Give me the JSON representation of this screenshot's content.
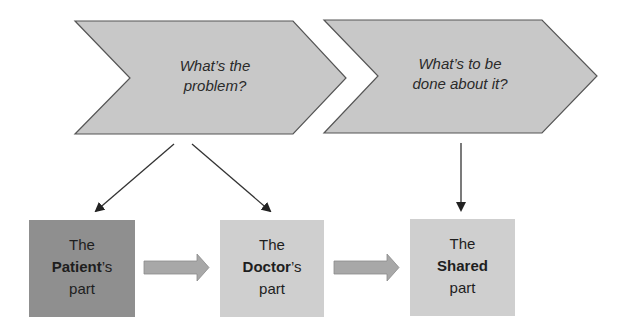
{
  "chevrons": [
    {
      "line1": "What’s the",
      "line2": "problem?"
    },
    {
      "line1": "What’s to be",
      "line2": "done about it?"
    }
  ],
  "boxes": [
    {
      "line1": "The",
      "bold": "Patient",
      "suffix": "’s",
      "line3": "part",
      "fill": "#8f8f8f"
    },
    {
      "line1": "The",
      "bold": "Doctor",
      "suffix": "’s",
      "line3": "part",
      "fill": "#cfcfcf"
    },
    {
      "line1": "The",
      "bold": "Shared",
      "suffix": "",
      "line3": "part",
      "fill": "#cfcfcf"
    }
  ],
  "colors": {
    "chevron_fill": "#c8c8c8",
    "chevron_stroke": "#555555",
    "block_arrow_fill": "#a8a8a8",
    "line_arrow": "#333333"
  }
}
